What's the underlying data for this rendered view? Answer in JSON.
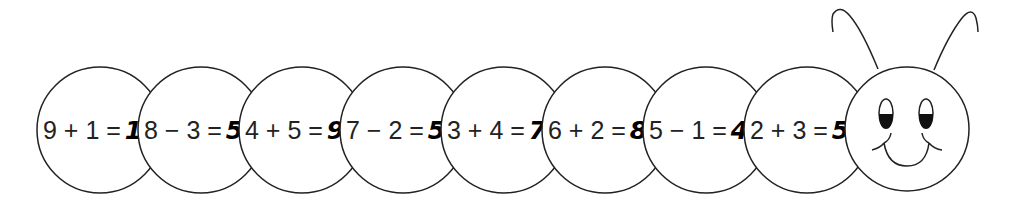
{
  "colors": {
    "stroke": "#222222",
    "fill": "#ffffff",
    "text": "#222222"
  },
  "segments": [
    {
      "expression": "9 + 1 =",
      "answer": "10",
      "cx": 100
    },
    {
      "expression": "8 − 3 =",
      "answer": "5",
      "cx": 201
    },
    {
      "expression": "4 + 5 =",
      "answer": "9",
      "cx": 302
    },
    {
      "expression": "7 − 2 =",
      "answer": "5",
      "cx": 403
    },
    {
      "expression": "3 + 4 =",
      "answer": "7",
      "cx": 504
    },
    {
      "expression": "6 + 2 =",
      "answer": "8",
      "cx": 605
    },
    {
      "expression": "5 − 1 =",
      "answer": "4",
      "cx": 706
    },
    {
      "expression": "2 + 3 =",
      "answer": "5",
      "cx": 807
    }
  ],
  "head": {
    "icon": "smiley-face-icon",
    "cx": 907,
    "cy": 129,
    "r": 62
  }
}
